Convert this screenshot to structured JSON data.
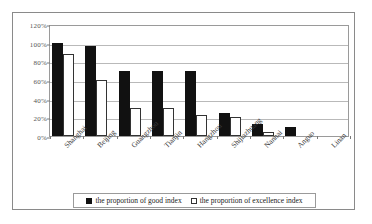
{
  "chart_data": {
    "type": "bar",
    "title": "",
    "subtitle": "",
    "xlabel": "",
    "ylabel": "",
    "ylim": [
      0,
      120
    ],
    "y_unit": "%",
    "grid": true,
    "legend_position": "bottom",
    "y_ticks": [
      "0%",
      "20%",
      "40%",
      "60%",
      "80%",
      "100%",
      "120%"
    ],
    "y_tick_values": [
      0,
      20,
      40,
      60,
      80,
      100,
      120
    ],
    "categories": [
      "Shanghai",
      "Beijing",
      "Guangzhou",
      "Tianjin",
      "Hangzhou",
      "Shijiazhuang",
      "Nanhai",
      "Anguo",
      "Linan"
    ],
    "series": [
      {
        "name": "the proportion of good index",
        "color": "#111111",
        "style": "filled",
        "values": [
          100,
          96,
          70,
          70,
          70,
          25,
          13,
          10,
          0
        ]
      },
      {
        "name": "the proportion of excellence index",
        "color": "#ffffff",
        "style": "hollow",
        "values": [
          88,
          60,
          30,
          30,
          22,
          20,
          4,
          0,
          0
        ]
      }
    ]
  },
  "legend": {
    "entries": [
      {
        "label": "the proportion of good index",
        "swatch": "filled-square-icon"
      },
      {
        "label": "the proportion of excellence  index",
        "swatch": "hollow-square-icon"
      }
    ]
  }
}
